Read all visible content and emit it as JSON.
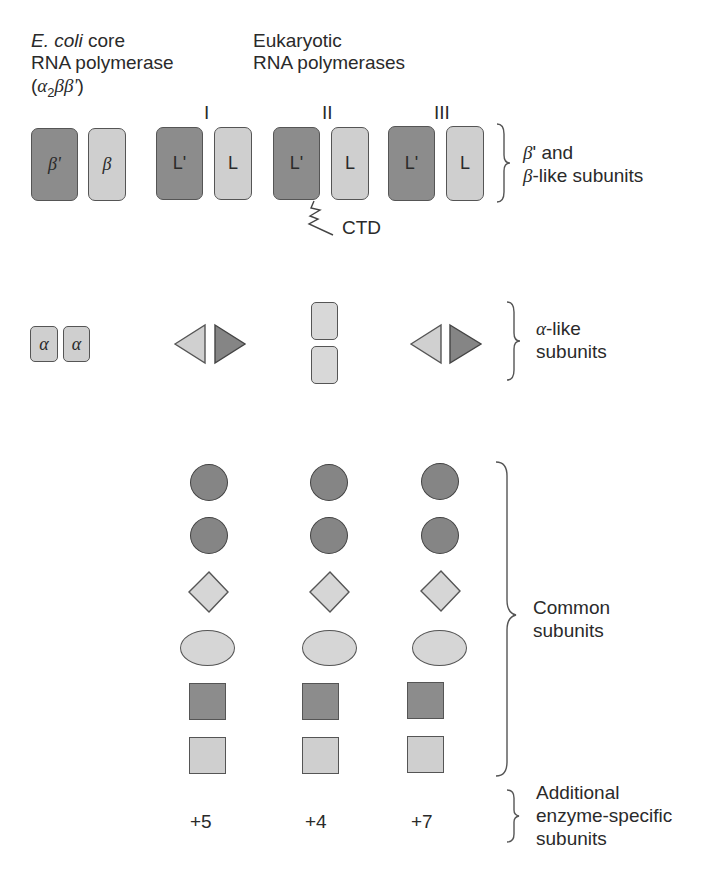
{
  "header": {
    "ecoli_title_italic": "E. coli",
    "ecoli_title_rest": " core",
    "ecoli_line2": "RNA polymerase",
    "ecoli_formula_open": "(",
    "ecoli_formula_alpha": "α",
    "ecoli_formula_sub": "2",
    "ecoli_formula_rest": "ββ'",
    "ecoli_formula_close": ")",
    "euk_line1": "Eukaryotic",
    "euk_line2": "RNA polymerases"
  },
  "polymerase_labels": [
    "I",
    "II",
    "III"
  ],
  "large_subunits": {
    "ecoli": [
      "β'",
      "β"
    ],
    "pol_I": [
      "L'",
      "L"
    ],
    "pol_II": [
      "L'",
      "L"
    ],
    "pol_III": [
      "L'",
      "L"
    ],
    "ctd_label": "CTD",
    "group_label_line1_greek": "β",
    "group_label_line1_rest": "' and",
    "group_label_line2_greek": "β",
    "group_label_line2_rest": "-like subunits"
  },
  "alpha_subunits": {
    "ecoli": [
      "α",
      "α"
    ],
    "group_label_line1_greek": "α",
    "group_label_line1_rest": "-like",
    "group_label_line2": "subunits"
  },
  "common_subunits": {
    "group_label_line1": "Common",
    "group_label_line2": "subunits",
    "shapes_per_polymerase": [
      "dark-circle",
      "dark-circle",
      "light-diamond",
      "light-ellipse",
      "dark-square",
      "light-square"
    ]
  },
  "additional_subunits": {
    "counts": [
      "+5",
      "+4",
      "+7"
    ],
    "group_label_line1": "Additional",
    "group_label_line2": "enzyme-specific",
    "group_label_line3": "subunits"
  },
  "colors": {
    "dark_fill": "#8c8c8c",
    "light_fill": "#cfcfcf",
    "outline": "#555555",
    "text": "#2a2a2a"
  }
}
